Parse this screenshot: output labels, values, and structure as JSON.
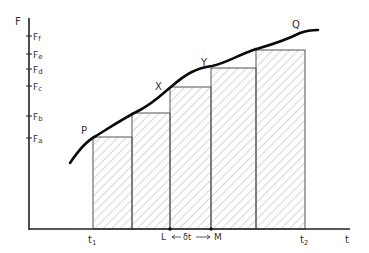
{
  "axes": {
    "y_label": "F",
    "x_label": "t",
    "y_ticks": [
      {
        "label": "F",
        "sub": "f",
        "y": 36
      },
      {
        "label": "F",
        "sub": "e",
        "y": 54
      },
      {
        "label": "F",
        "sub": "d",
        "y": 69
      },
      {
        "label": "F",
        "sub": "c",
        "y": 86
      },
      {
        "label": "F",
        "sub": "b",
        "y": 116
      },
      {
        "label": "F",
        "sub": "a",
        "y": 138
      }
    ]
  },
  "points": {
    "P": "P",
    "X": "X",
    "Y": "Y",
    "Q": "Q"
  },
  "x_marks": {
    "t1": "t",
    "t1_sub": "1",
    "t2": "t",
    "t2_sub": "2",
    "L": "L",
    "M": "M",
    "delta": "δt"
  },
  "bars": [
    {
      "x": 93,
      "top": 137,
      "right": 132
    },
    {
      "x": 132,
      "top": 113,
      "right": 170
    },
    {
      "x": 170,
      "top": 87,
      "right": 211
    },
    {
      "x": 211,
      "top": 68,
      "right": 256
    },
    {
      "x": 256,
      "top": 50,
      "right": 305
    }
  ],
  "colors": {
    "ink": "#111111",
    "hatch": "#888888",
    "bar_edge": "#555555"
  }
}
